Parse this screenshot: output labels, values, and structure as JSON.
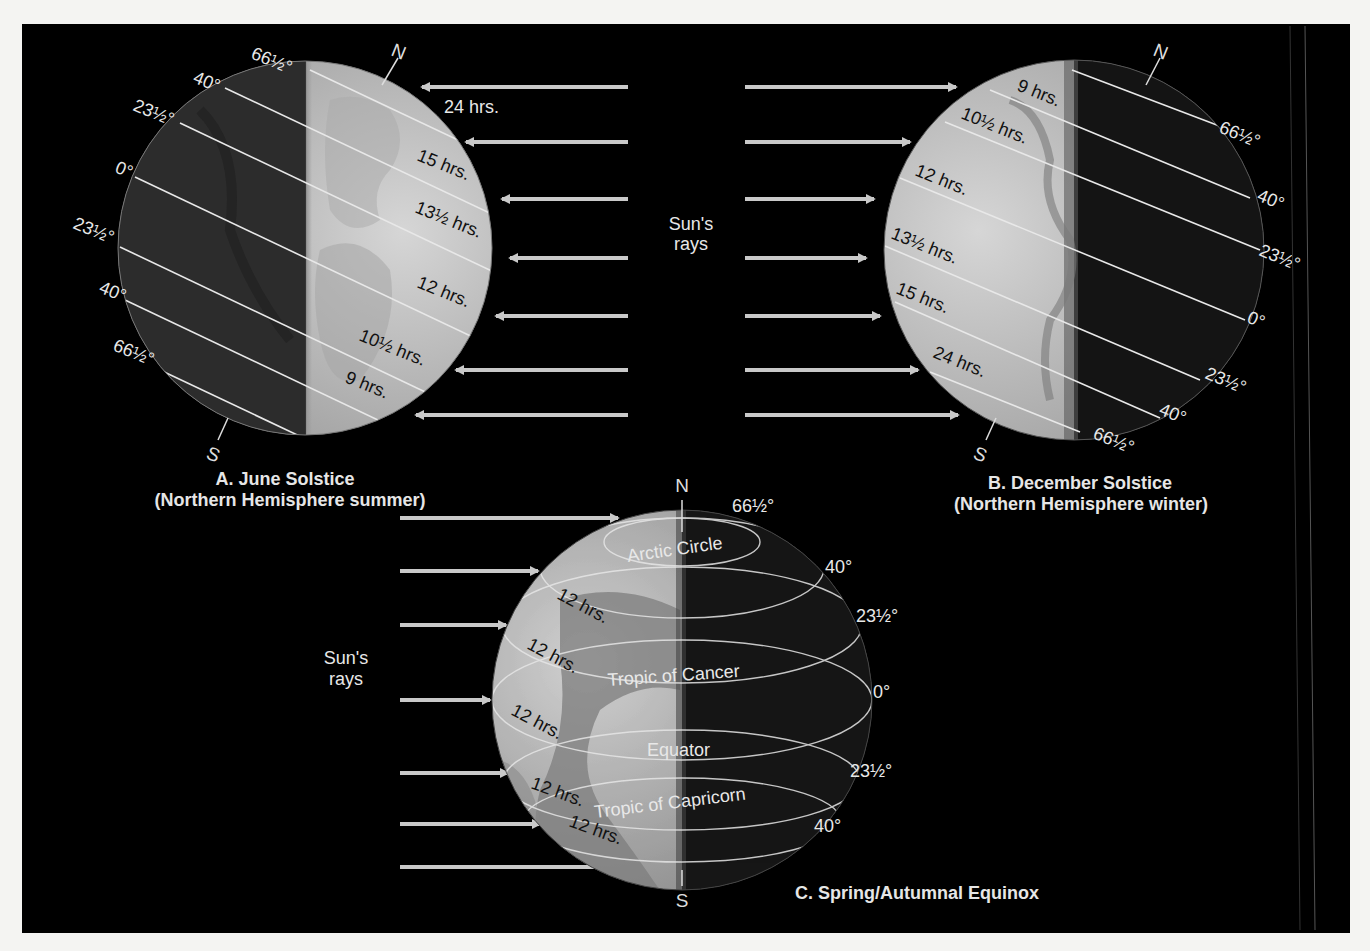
{
  "figure": {
    "panel_a": {
      "caption_line1": "A. June Solstice",
      "caption_line2": "(Northern Hemisphere summer)",
      "north": "N",
      "south": "S",
      "latitudes": [
        "66½°",
        "40°",
        "23½°",
        "0°",
        "23½°",
        "40°",
        "66½°"
      ],
      "day_lengths": [
        "24 hrs.",
        "15 hrs.",
        "13½ hrs.",
        "12 hrs.",
        "10½ hrs.",
        "9 hrs."
      ],
      "ray_direction": "left"
    },
    "panel_b": {
      "caption_line1": "B. December Solstice",
      "caption_line2": "(Northern Hemisphere winter)",
      "north": "N",
      "south": "S",
      "latitudes": [
        "66½°",
        "40°",
        "23½°",
        "0°",
        "23½°",
        "40°",
        "66½°"
      ],
      "day_lengths": [
        "9 hrs.",
        "10½ hrs.",
        "12 hrs.",
        "13½ hrs.",
        "15 hrs.",
        "24 hrs."
      ],
      "ray_direction": "right"
    },
    "panel_c": {
      "caption": "C. Spring/Autumnal Equinox",
      "north": "N",
      "south": "S",
      "latitudes": [
        "66½°",
        "40°",
        "23½°",
        "0°",
        "23½°",
        "40°"
      ],
      "circle_names": [
        "Arctic Circle",
        "Tropic of Cancer",
        "Equator",
        "Tropic of Capricorn"
      ],
      "day_lengths": [
        "12 hrs.",
        "12 hrs.",
        "12 hrs.",
        "12 hrs.",
        "12 hrs."
      ]
    },
    "sun_rays_top": {
      "line1": "Sun's",
      "line2": "rays"
    },
    "sun_rays_bottom": {
      "line1": "Sun's",
      "line2": "rays"
    },
    "colors": {
      "background": "#000000",
      "day_side": "#c8c8c8",
      "night_side": "#2a2a2a",
      "ray": "#c9c9c9",
      "page": "#f4f4f2"
    }
  }
}
